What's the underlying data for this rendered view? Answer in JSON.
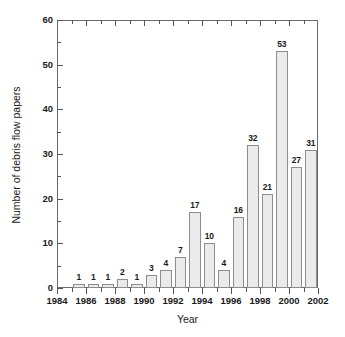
{
  "chart_data": {
    "type": "bar",
    "title": "",
    "subtitle": "",
    "xlabel": "Year",
    "ylabel": "Number of debris flow papers",
    "categories": [
      1985,
      1986,
      1987,
      1988,
      1989,
      1990,
      1991,
      1992,
      1993,
      1994,
      1995,
      1996,
      1997,
      1998,
      1999,
      2000,
      2001
    ],
    "values": [
      1,
      1,
      1,
      2,
      1,
      3,
      4,
      7,
      17,
      10,
      4,
      16,
      32,
      21,
      53,
      27,
      31
    ],
    "data_labels": [
      "1",
      "1",
      "1",
      "2",
      "1",
      "3",
      "4",
      "7",
      "17",
      "10",
      "4",
      "16",
      "32",
      "21",
      "53",
      "27",
      "31"
    ],
    "xlim": [
      1984,
      2002
    ],
    "ylim": [
      0,
      60
    ],
    "x_ticks_major": [
      1984,
      1986,
      1988,
      1990,
      1992,
      1994,
      1996,
      1998,
      2000,
      2002
    ],
    "x_tick_labels": [
      "1984",
      "1986",
      "1988",
      "1990",
      "1992",
      "1994",
      "1996",
      "1998",
      "2000",
      "2002"
    ],
    "x_ticks_minor": [
      1985,
      1987,
      1989,
      1991,
      1993,
      1995,
      1997,
      1999,
      2001
    ],
    "y_ticks_major": [
      0,
      10,
      20,
      30,
      40,
      50,
      60
    ],
    "y_tick_labels": [
      "0",
      "10",
      "20",
      "30",
      "40",
      "50",
      "60"
    ],
    "y_ticks_minor": [
      5,
      15,
      25,
      35,
      45,
      55
    ],
    "grid": false,
    "legend": null,
    "bar_fill_color": "#ebebeb",
    "bar_edge_color": "#8d8d8d",
    "axis_color": "#6b6b6b",
    "text_color": "#1a1a1a",
    "background_color": "#ffffff"
  }
}
